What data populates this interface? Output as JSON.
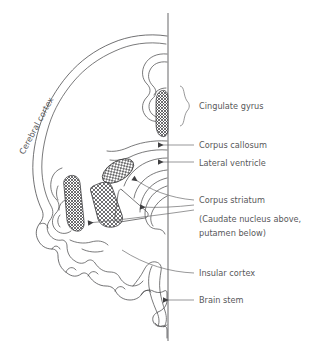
{
  "figure": {
    "background_color": "#ffffff",
    "line_color": "#4d4d4f",
    "text_color": "#58585a"
  },
  "rotated_label": {
    "text": "Cerebral cortex",
    "rotation_deg": -62
  },
  "labels": [
    {
      "id": "cingulate-gyrus",
      "text": "Cingulate gyrus",
      "x": 199,
      "y": 106,
      "marker": "brace"
    },
    {
      "id": "corpus-callosum",
      "text": "Corpus callosum",
      "x": 199,
      "y": 148,
      "marker": "arrow"
    },
    {
      "id": "lateral-ventricle",
      "text": "Lateral ventricle",
      "x": 199,
      "y": 167,
      "marker": "arrow"
    },
    {
      "id": "corpus-striatum",
      "text": "Corpus striatum",
      "x": 199,
      "y": 203,
      "marker": "line"
    },
    {
      "id": "insular-cortex",
      "text": "Insular cortex",
      "x": 199,
      "y": 276,
      "marker": "line"
    },
    {
      "id": "brain-stem",
      "text": "Brain stem",
      "x": 199,
      "y": 303,
      "marker": "arrow"
    }
  ],
  "sublabel": {
    "line1": "(Caudate nucleus above,",
    "line2": "putamen below)",
    "x": 199,
    "y1": 222,
    "y2": 236
  },
  "structures": [
    {
      "id": "cingulate-gyrus-hatch",
      "name": "cingulate gyrus",
      "fill": "crosshatch"
    },
    {
      "id": "caudate-nucleus-hatch",
      "name": "caudate nucleus",
      "fill": "crosshatch"
    },
    {
      "id": "putamen-hatch",
      "name": "putamen",
      "fill": "crosshatch"
    },
    {
      "id": "thalamus-region",
      "name": "thalamus",
      "fill": "none"
    },
    {
      "id": "brain-stem-shape",
      "name": "brain stem",
      "fill": "none"
    }
  ],
  "midline": {
    "x": 168,
    "y_top": 13,
    "y_bottom": 341
  }
}
